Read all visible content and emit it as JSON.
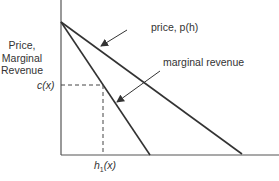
{
  "diagram": {
    "y_axis_label": [
      "Price,",
      "Marginal",
      "Revenue"
    ],
    "curves": {
      "price": {
        "label": "price, p(h)",
        "color": "#333333"
      },
      "marginal_revenue": {
        "label": "marginal revenue",
        "color": "#333333"
      }
    },
    "markers": {
      "c_label": "c(x)",
      "h_label_base": "h",
      "h_label_sub": "1",
      "h_label_arg": "(x)"
    },
    "colors": {
      "axis": "#444444",
      "line": "#333333",
      "dashed": "#444444",
      "text": "#333333"
    }
  }
}
